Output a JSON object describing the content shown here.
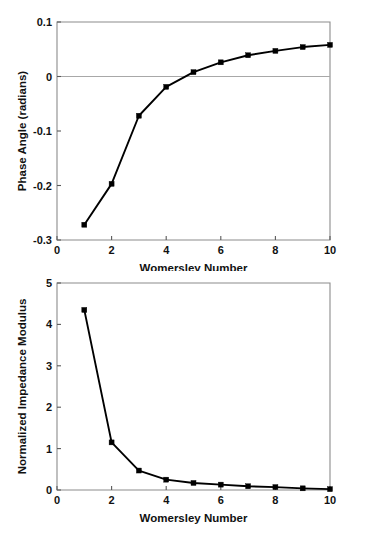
{
  "chart_data": [
    {
      "id": "phase-angle-chart",
      "type": "line",
      "title": "",
      "xlabel": "Womersley Number",
      "ylabel": "Phase Angle (radians)",
      "x": [
        1,
        2,
        3,
        4,
        5,
        6,
        7,
        8,
        9,
        10
      ],
      "values": [
        -0.272,
        -0.197,
        -0.072,
        -0.019,
        0.008,
        0.026,
        0.039,
        0.047,
        0.054,
        0.058
      ],
      "xlim": [
        0,
        10
      ],
      "ylim": [
        -0.3,
        0.1
      ],
      "xticks": [
        0,
        2,
        4,
        6,
        8,
        10
      ],
      "xtick_labels": [
        "0",
        "2",
        "4",
        "6",
        "8",
        "10"
      ],
      "yticks": [
        0.1,
        0,
        -0.1,
        -0.2,
        -0.3
      ],
      "ytick_labels": [
        "0.1",
        "0",
        "-0.1",
        "-0.2",
        "-0.3"
      ],
      "grid": false,
      "reference_lines": [
        {
          "axis": "y",
          "value": 0,
          "color": "#a8a8a8"
        }
      ],
      "legend": null,
      "marker": "filled-square",
      "line_color": "#000000",
      "frame_color": "#8c8c8c"
    },
    {
      "id": "impedance-modulus-chart",
      "type": "line",
      "title": "",
      "xlabel": "Womersley Number",
      "ylabel": "Normalized Impedance Modulus",
      "x": [
        1,
        2,
        3,
        4,
        5,
        6,
        7,
        8,
        9,
        10
      ],
      "values": [
        4.35,
        1.15,
        0.47,
        0.25,
        0.17,
        0.13,
        0.09,
        0.07,
        0.04,
        0.02
      ],
      "xlim": [
        0,
        10
      ],
      "ylim": [
        0,
        5
      ],
      "xticks": [
        0,
        2,
        4,
        6,
        8,
        10
      ],
      "xtick_labels": [
        "0",
        "2",
        "4",
        "6",
        "8",
        "10"
      ],
      "yticks": [
        0,
        1,
        2,
        3,
        4,
        5
      ],
      "ytick_labels": [
        "0",
        "1",
        "2",
        "3",
        "4",
        "5"
      ],
      "grid": false,
      "reference_lines": [],
      "legend": null,
      "marker": "filled-square",
      "line_color": "#000000",
      "frame_color": "#8c8c8c"
    }
  ]
}
